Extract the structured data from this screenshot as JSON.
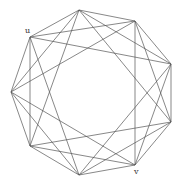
{
  "diagram": {
    "type": "circulant-graph",
    "vertex_count": 9,
    "vertices": [
      {
        "id": "v0",
        "x": 79,
        "y": 10,
        "label": ""
      },
      {
        "id": "v1",
        "x": 135,
        "y": 21,
        "label": ""
      },
      {
        "id": "v2",
        "x": 171,
        "y": 64,
        "label": ""
      },
      {
        "id": "v3",
        "x": 171,
        "y": 122,
        "label": ""
      },
      {
        "id": "v4",
        "x": 135,
        "y": 165,
        "label": "v"
      },
      {
        "id": "v5",
        "x": 79,
        "y": 175,
        "label": ""
      },
      {
        "id": "v6",
        "x": 30,
        "y": 146,
        "label": ""
      },
      {
        "id": "v7",
        "x": 11,
        "y": 92,
        "label": ""
      },
      {
        "id": "v8",
        "x": 30,
        "y": 37,
        "label": "u"
      }
    ],
    "jumps": [
      1,
      2,
      3
    ],
    "labels": {
      "u": {
        "text": "u",
        "x": 25,
        "y": 27
      },
      "v": {
        "text": "v",
        "x": 134,
        "y": 168
      }
    },
    "colors": {
      "edge": "#555555",
      "background": "#ffffff",
      "label": "#333333"
    }
  }
}
